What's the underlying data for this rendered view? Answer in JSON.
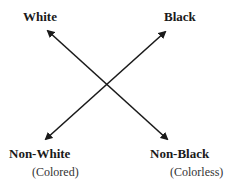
{
  "diagram": {
    "type": "opposition-square",
    "top_left": {
      "label": "White"
    },
    "top_right": {
      "label": "Black"
    },
    "bottom_left": {
      "label": "Non-White",
      "sublabel": "(Colored)"
    },
    "bottom_right": {
      "label": "Non-Black",
      "sublabel": "(Colorless)"
    },
    "arrows": [
      {
        "from": "top_left",
        "to": "bottom_right",
        "bidirectional": true
      },
      {
        "from": "top_right",
        "to": "bottom_left",
        "bidirectional": true
      }
    ],
    "colors": {
      "line": "#1a1a1a",
      "background": "#ffffff"
    }
  }
}
